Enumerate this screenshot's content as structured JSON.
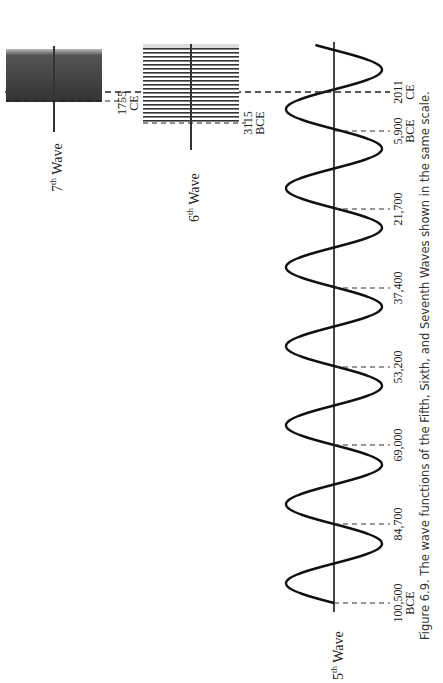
{
  "caption": {
    "line1": "Figure 6.9. The wave functions of the Fifth, Sixth, and Seventh Waves shown in the same scale."
  },
  "waves": {
    "fifth": {
      "num": "5",
      "sup": "th",
      "word": "Wave"
    },
    "sixth": {
      "num": "6",
      "sup": "th",
      "word": "Wave"
    },
    "seventh": {
      "num": "7",
      "sup": "th",
      "word": "Wave"
    }
  },
  "chart_data": {
    "type": "line",
    "title": "Figure 6.9. The wave functions of the Fifth, Sixth, and Seventh Waves shown in the same scale.",
    "orientation": "rotated 90° counter-clockwise (time axis runs bottom-to-top)",
    "series": [
      {
        "name": "5th Wave",
        "shape": "sine",
        "cycles": 6.5,
        "start": "100,500 BCE",
        "end": "2011 CE",
        "tick_labels": [
          "100,500 BCE",
          "84,700",
          "69,000",
          "53,200",
          "37,400",
          "21,700",
          "5,900 BCE",
          "2011 CE"
        ],
        "tick_values_years_bce": [
          100500,
          84700,
          69000,
          53200,
          37400,
          21700,
          5900,
          -2011
        ]
      },
      {
        "name": "6th Wave",
        "shape": "compressed sine (dense oscillation)",
        "start": "3115 BCE",
        "end": "2011 CE",
        "tick_labels": [
          "3115 BCE"
        ]
      },
      {
        "name": "7th Wave",
        "shape": "compressed sine (very dense oscillation)",
        "start": "1755 CE",
        "end": "2011 CE",
        "tick_labels": [
          "1755 CE"
        ]
      }
    ],
    "reference_lines": [
      "2011 CE"
    ],
    "grid": false,
    "legend": "none; waves labelled directly at axis ends"
  },
  "ticks": {
    "t100500": {
      "line1": "100,500",
      "line2": "BCE"
    },
    "t84700": {
      "line1": "84,700"
    },
    "t69000": {
      "line1": "69,000"
    },
    "t53200": {
      "line1": "53,200"
    },
    "t37400": {
      "line1": "37,400"
    },
    "t21700": {
      "line1": "21,700"
    },
    "t5900": {
      "line1": "5,900",
      "line2": "BCE"
    },
    "t2011": {
      "line1": "2011",
      "line2": "CE"
    },
    "t3115": {
      "line1": "3115",
      "line2": "BCE"
    },
    "t1755": {
      "line1": "1755",
      "line2": "CE"
    }
  }
}
